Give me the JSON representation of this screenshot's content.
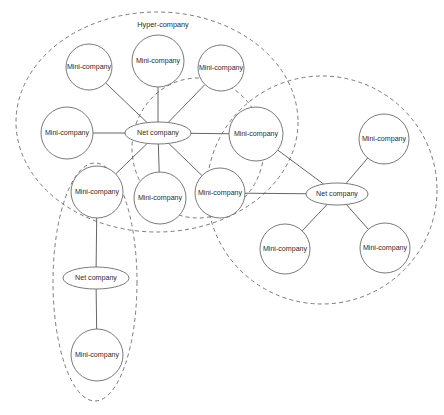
{
  "diagram": {
    "canvas": {
      "width": 444,
      "height": 415,
      "background": "#ffffff"
    },
    "style": {
      "node_stroke": "#6b6b6b",
      "node_fill": "#ffffff",
      "edge_stroke": "#555555",
      "boundary_stroke": "#6b6b6b",
      "text_color": "#2b2b2b"
    },
    "groups": [
      {
        "id": "hyper-company",
        "label": "Hyper-company",
        "shape": "ellipse",
        "cx": 157,
        "cy": 122,
        "rx": 141,
        "ry": 110,
        "label_x": 163,
        "label_y": 25
      },
      {
        "id": "group-right",
        "label": "",
        "shape": "ellipse",
        "cx": 322,
        "cy": 190,
        "rx": 115,
        "ry": 114,
        "label_x": 0,
        "label_y": 0
      },
      {
        "id": "group-middle",
        "label": "",
        "shape": "ellipse",
        "cx": 198,
        "cy": 148,
        "rx": 66,
        "ry": 70,
        "label_x": 0,
        "label_y": 0
      },
      {
        "id": "group-bottom-left",
        "label": "",
        "shape": "ellipse",
        "cx": 95,
        "cy": 282,
        "rx": 42,
        "ry": 119,
        "label_x": 0,
        "label_y": 0
      }
    ],
    "nodes": [
      {
        "id": "mini-1",
        "label": "Mini-company",
        "type": "circle",
        "cx": 89,
        "cy": 67,
        "r": 23
      },
      {
        "id": "mini-2",
        "label": "Mini-company",
        "type": "circle",
        "cx": 158,
        "cy": 61,
        "r": 26
      },
      {
        "id": "mini-3",
        "label": "Mini-company",
        "type": "circle",
        "cx": 221,
        "cy": 68,
        "r": 23
      },
      {
        "id": "mini-4",
        "label": "Mini-company",
        "type": "circle",
        "cx": 67,
        "cy": 133,
        "r": 26
      },
      {
        "id": "net-1",
        "label": "Net company",
        "type": "ellipse",
        "cx": 158,
        "cy": 133,
        "rx": 33,
        "ry": 11
      },
      {
        "id": "mini-5",
        "label": "Mini-company",
        "type": "circle",
        "cx": 256,
        "cy": 134,
        "r": 27
      },
      {
        "id": "mini-6",
        "label": "Mini-company",
        "type": "circle",
        "cx": 384,
        "cy": 139,
        "r": 25
      },
      {
        "id": "mini-7",
        "label": "Mini-company",
        "type": "circle",
        "cx": 97,
        "cy": 192,
        "r": 26
      },
      {
        "id": "mini-8",
        "label": "Mini-company",
        "type": "circle",
        "cx": 160,
        "cy": 198,
        "r": 26
      },
      {
        "id": "mini-9",
        "label": "Mini-company",
        "type": "circle",
        "cx": 220,
        "cy": 193,
        "r": 25
      },
      {
        "id": "net-2",
        "label": "Net company",
        "type": "ellipse",
        "cx": 337,
        "cy": 194,
        "rx": 31,
        "ry": 11
      },
      {
        "id": "mini-10",
        "label": "Mini-company",
        "type": "circle",
        "cx": 285,
        "cy": 249,
        "r": 25
      },
      {
        "id": "mini-11",
        "label": "Mini-company",
        "type": "circle",
        "cx": 385,
        "cy": 248,
        "r": 25
      },
      {
        "id": "net-3",
        "label": "Net company",
        "type": "ellipse",
        "cx": 96,
        "cy": 278,
        "rx": 33,
        "ry": 11
      },
      {
        "id": "mini-12",
        "label": "Mini-company",
        "type": "circle",
        "cx": 97,
        "cy": 355,
        "r": 26
      }
    ],
    "edges": [
      {
        "from": "net-1",
        "to": "mini-1"
      },
      {
        "from": "net-1",
        "to": "mini-2"
      },
      {
        "from": "net-1",
        "to": "mini-3"
      },
      {
        "from": "net-1",
        "to": "mini-4"
      },
      {
        "from": "net-1",
        "to": "mini-5"
      },
      {
        "from": "net-1",
        "to": "mini-7"
      },
      {
        "from": "net-1",
        "to": "mini-8"
      },
      {
        "from": "net-1",
        "to": "mini-9"
      },
      {
        "from": "net-2",
        "to": "mini-5"
      },
      {
        "from": "net-2",
        "to": "mini-6"
      },
      {
        "from": "net-2",
        "to": "mini-9"
      },
      {
        "from": "net-2",
        "to": "mini-10"
      },
      {
        "from": "net-2",
        "to": "mini-11"
      },
      {
        "from": "net-3",
        "to": "mini-7"
      },
      {
        "from": "net-3",
        "to": "mini-12"
      }
    ]
  }
}
